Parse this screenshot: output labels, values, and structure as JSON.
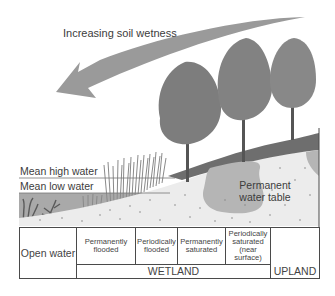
{
  "diagram": {
    "arrow_label": "Increasing soil wetness",
    "water_levels": {
      "high": "Mean high water",
      "low": "Mean low water"
    },
    "water_table_label": "Permanent water table",
    "zones": {
      "open_water": "Open water",
      "wetland_subzones": [
        "Permanently flooded",
        "Periodically flooded",
        "Permanently saturated",
        "Periodically saturated (near surface)"
      ],
      "wetland": "WETLAND",
      "upland": "UPLAND"
    },
    "colors": {
      "arrow": "#9a9a9a",
      "water": "#a8a8a8",
      "soil": "#ececec",
      "water_table": "#b4b4b4",
      "topsoil": "#6e6e6e",
      "tree_foliage": "#7d7d7d",
      "border": "#4a4a4a"
    }
  }
}
